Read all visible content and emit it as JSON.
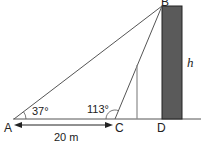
{
  "diagram": {
    "type": "geometry-trig",
    "points": {
      "A": "A",
      "B": "B",
      "C": "C",
      "D": "D"
    },
    "angles": {
      "at_A": "37°",
      "at_C": "113°"
    },
    "lengths": {
      "AC": "20 m"
    },
    "height_label": "h",
    "colors": {
      "tower_fill": "#5a5a5a",
      "lines": "#555555",
      "post": "#8a8a8a"
    }
  }
}
